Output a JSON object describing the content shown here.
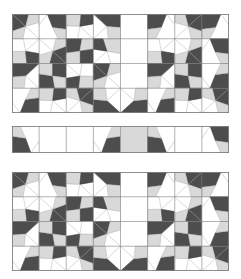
{
  "figure": {
    "title": "",
    "background": "#ffffff",
    "width": 241,
    "height": 279
  },
  "palette": {
    "dark": "#4d4d4d",
    "light": "#d9d9d9",
    "white": "#ffffff",
    "stroke_dark": "#3a3a3a",
    "stroke_light": "#b3b3b3",
    "border": "#808080"
  },
  "panels": [
    {
      "name": "top-panel",
      "x": 12,
      "y": 14,
      "width": 217,
      "height": 99,
      "cols": 8,
      "rows": 4,
      "cell": 27.125,
      "row_height": 24.75,
      "grid": [
        [
          "nw-dark-star",
          "ne-dark-kite",
          "nw-light-fan",
          "ne-dark-wedge",
          "blank-white",
          "nw-dark-kite",
          "ne-dark-star",
          "nw-dark-kite"
        ],
        [
          "sw-light-fan",
          "se-dark-star",
          "nw-dark-pinwheel",
          "ne-light-kite",
          "blank-white",
          "sw-light-fan",
          "se-dark-star",
          "ne-dark-kite"
        ],
        [
          "nw-dark-wedge",
          "sw-dark-pinwheel",
          "se-light-fan",
          "nw-dark-star",
          "blank-white",
          "nw-dark-wedge",
          "sw-dark-pinwheel",
          "se-dark-kite"
        ],
        [
          "se-dark-kite",
          "nw-light-fan",
          "ne-dark-star",
          "sw-dark-wedge",
          "se-dark-wedge",
          "se-dark-kite",
          "nw-light-fan",
          "ne-dark-star"
        ]
      ]
    },
    {
      "name": "middle-strip",
      "x": 12,
      "y": 126,
      "width": 217,
      "height": 27,
      "cols": 8,
      "rows": 1,
      "cell": 27.125,
      "grid": [
        [
          "sw-dark-kite",
          "blank-white",
          "blank-white",
          "se-dark-kite",
          "solid-light",
          "sw-dark-kite",
          "blank-white",
          "ne-dark-kite"
        ]
      ]
    },
    {
      "name": "bottom-panel",
      "x": 12,
      "y": 172,
      "width": 217,
      "height": 99,
      "cols": 8,
      "rows": 4,
      "cell": 27.125,
      "row_height": 24.75,
      "grid": [
        [
          "nw-dark-star",
          "ne-dark-kite",
          "nw-light-fan",
          "ne-dark-wedge",
          "blank-white",
          "nw-dark-kite",
          "ne-dark-star",
          "nw-dark-kite"
        ],
        [
          "sw-light-fan",
          "se-dark-star",
          "nw-dark-pinwheel",
          "ne-light-kite",
          "blank-white",
          "sw-light-fan",
          "se-dark-star",
          "ne-dark-kite"
        ],
        [
          "nw-dark-wedge",
          "sw-dark-pinwheel",
          "se-light-fan",
          "nw-dark-star",
          "blank-white",
          "nw-dark-wedge",
          "sw-dark-pinwheel",
          "se-dark-kite"
        ],
        [
          "se-dark-kite",
          "nw-light-fan",
          "ne-dark-star",
          "sw-dark-wedge",
          "se-dark-wedge",
          "se-dark-kite",
          "nw-light-fan",
          "ne-dark-star"
        ]
      ]
    }
  ],
  "legend": {
    "entries": []
  }
}
